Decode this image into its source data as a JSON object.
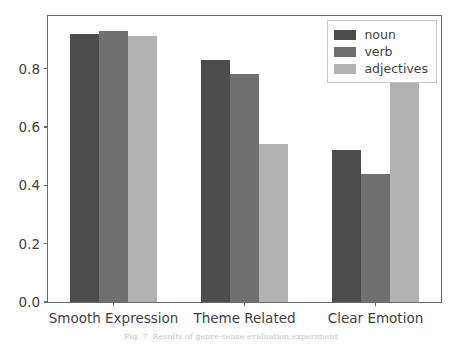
{
  "chart_data": {
    "type": "bar",
    "title": "",
    "xlabel": "",
    "ylabel": "",
    "categories": [
      "Smooth Expression",
      "Theme Related",
      "Clear Emotion"
    ],
    "series": [
      {
        "name": "noun",
        "color": "#4c4c4c",
        "values": [
          0.92,
          0.83,
          0.52
        ]
      },
      {
        "name": "verb",
        "color": "#6f6f6f",
        "values": [
          0.93,
          0.78,
          0.44
        ]
      },
      {
        "name": "adjectives",
        "color": "#b2b2b2",
        "values": [
          0.91,
          0.54,
          0.78
        ]
      }
    ],
    "ylim": [
      0.0,
      0.98
    ],
    "yticks": [
      {
        "value": 0.0,
        "label": "0.0"
      },
      {
        "value": 0.2,
        "label": "0.2"
      },
      {
        "value": 0.4,
        "label": "0.4"
      },
      {
        "value": 0.6,
        "label": "0.6"
      },
      {
        "value": 0.8,
        "label": "0.8"
      }
    ],
    "grid": false,
    "legend_position": "upper right"
  },
  "legend": {
    "entries": [
      {
        "label": "noun"
      },
      {
        "label": "verb"
      },
      {
        "label": "adjectives"
      }
    ]
  },
  "caption": {
    "text": "Fig. 7.  Results of genre-sense evaluation experiment"
  }
}
